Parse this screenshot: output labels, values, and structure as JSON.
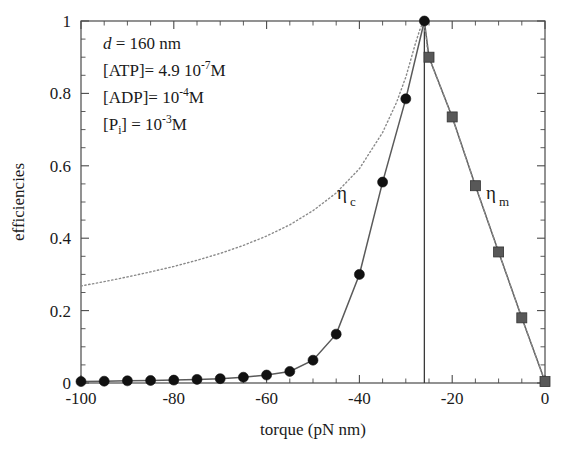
{
  "figure": {
    "name": "efficiencies-vs-torque-plot",
    "background_color": "#ffffff"
  },
  "annotations": {
    "line1_symbol": "d",
    "line1_text": " = 160 nm",
    "line2_prefix": "[ATP]= 4.9 10",
    "line2_exp": "-7",
    "line2_suffix": "M",
    "line3_prefix": "[ADP]= 10",
    "line3_exp": "-4",
    "line3_suffix": "M",
    "line4_prefix": "[P",
    "line4_sub": "i",
    "line4_mid": "] = 10",
    "line4_exp": "-3",
    "line4_suffix": "M"
  },
  "series_labels": {
    "carnot": {
      "symbol": "η",
      "sub": "c"
    },
    "motor": {
      "symbol": "η",
      "sub": "m"
    }
  },
  "chart_data": {
    "type": "line",
    "title": "",
    "xlabel": "torque  (pN nm)",
    "ylabel": "efficiencies",
    "xlim": [
      -100,
      0
    ],
    "ylim": [
      0,
      1
    ],
    "xticks": [
      -100,
      -80,
      -60,
      -40,
      -20,
      0
    ],
    "xtick_labels": [
      "-100",
      "-80",
      "-60",
      "-40",
      "-20",
      "0"
    ],
    "xminor_step": 5,
    "yticks": [
      0,
      0.2,
      0.4,
      0.6,
      0.8,
      1
    ],
    "ytick_labels": [
      "0",
      "0.2",
      "0.4",
      "0.6",
      "0.8",
      "1"
    ],
    "yminor_step": 0.05,
    "grid": false,
    "legend_position": "inline-annotation",
    "stall_torque": -26,
    "series": [
      {
        "name": "η_c",
        "label": "eta-c",
        "style": "solid-with-circles",
        "marker": "circle",
        "color": "#111111",
        "x": [
          -100,
          -95,
          -90,
          -85,
          -80,
          -75,
          -70,
          -65,
          -60,
          -55,
          -50,
          -45,
          -40,
          -35,
          -30,
          -26
        ],
        "y": [
          0.004,
          0.005,
          0.006,
          0.007,
          0.008,
          0.01,
          0.012,
          0.016,
          0.022,
          0.032,
          0.063,
          0.135,
          0.3,
          0.555,
          0.785,
          1.0
        ]
      },
      {
        "name": "η_m",
        "label": "eta-m",
        "style": "solid-with-squares",
        "marker": "square",
        "color": "#585858",
        "x": [
          -26,
          -25,
          -20,
          -15,
          -10,
          -5,
          0
        ],
        "y": [
          1.0,
          0.9,
          0.735,
          0.545,
          0.362,
          0.18,
          0.004
        ]
      },
      {
        "name": "Carnot bound",
        "label": "dotted-reference-curve",
        "style": "dotted",
        "marker": "none",
        "color": "#8a8a8a",
        "x": [
          -100,
          -95,
          -90,
          -85,
          -80,
          -75,
          -70,
          -65,
          -60,
          -55,
          -50,
          -45,
          -40,
          -35,
          -32,
          -30,
          -28,
          -27,
          -26.2,
          -25.6,
          -25.2,
          -20,
          -15,
          -10,
          -5,
          0
        ],
        "y": [
          0.268,
          0.28,
          0.293,
          0.307,
          0.322,
          0.339,
          0.358,
          0.38,
          0.406,
          0.437,
          0.476,
          0.525,
          0.592,
          0.692,
          0.775,
          0.845,
          0.935,
          0.975,
          1.0,
          0.955,
          0.905,
          0.735,
          0.545,
          0.362,
          0.18,
          0.004
        ]
      }
    ]
  }
}
